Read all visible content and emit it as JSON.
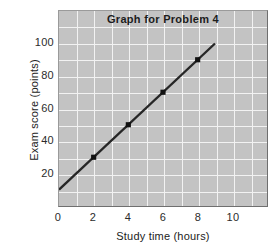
{
  "chart_data": {
    "type": "line",
    "title": "Graph for Problem 4",
    "xlabel": "Study time (hours)",
    "ylabel": "Exam score (points)",
    "xlim": [
      0,
      12
    ],
    "ylim": [
      0,
      120
    ],
    "xticks": [
      0,
      2,
      4,
      6,
      8,
      10
    ],
    "xtick_labels": [
      "0",
      "2",
      "4",
      "6",
      "8",
      "10"
    ],
    "yticks": [
      20,
      40,
      60,
      80,
      100
    ],
    "ytick_labels": [
      "20",
      "40",
      "60",
      "80",
      "100"
    ],
    "grid": true,
    "grid_color": "#f2f2f2",
    "plot_background": "#c3c3c3",
    "legend": null,
    "series": [
      {
        "name": "Exam score vs study time",
        "color": "#262626",
        "line_from": {
          "x": 0,
          "y": 10
        },
        "line_to": {
          "x": 9,
          "y": 100
        },
        "x": [
          2,
          4,
          6,
          8
        ],
        "values": [
          30,
          50,
          70,
          90
        ],
        "marker": "square",
        "marker_color": "#111111"
      }
    ]
  },
  "chart": {
    "title": "Graph for Problem 4",
    "xlabel": "Study time (hours)",
    "ylabel": "Exam score (points)",
    "xticks": [
      {
        "label": "0",
        "value": 0
      },
      {
        "label": "2",
        "value": 2
      },
      {
        "label": "4",
        "value": 4
      },
      {
        "label": "6",
        "value": 6
      },
      {
        "label": "8",
        "value": 8
      },
      {
        "label": "10",
        "value": 10
      }
    ],
    "yticks": [
      {
        "label": "100",
        "value": 100
      },
      {
        "label": "80",
        "value": 80
      },
      {
        "label": "60",
        "value": 60
      },
      {
        "label": "40",
        "value": 40
      },
      {
        "label": "20",
        "value": 20
      }
    ]
  }
}
